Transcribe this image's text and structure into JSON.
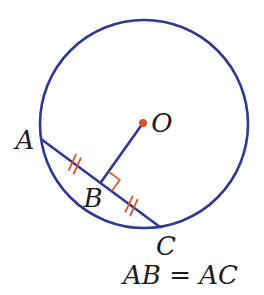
{
  "figure": {
    "canvas": {
      "width": 264,
      "height": 295
    },
    "colors": {
      "line_blue": "#2d3a92",
      "accent_orange": "#dd5227",
      "label_black": "#1b1b1b",
      "background": "#ffffff"
    },
    "circle": {
      "cx": 144,
      "cy": 124,
      "r": 104,
      "stroke_width": 2.6
    },
    "center_dot": {
      "x": 143,
      "y": 123,
      "radius": 4,
      "label": "O",
      "label_x": 162,
      "label_y": 132
    },
    "points": [
      {
        "name": "A",
        "x": 41,
        "y": 139,
        "label": "A",
        "label_x": 25,
        "label_y": 149
      },
      {
        "name": "B",
        "x": 100.4,
        "y": 182.9,
        "label": "B",
        "label_x": 93,
        "label_y": 207
      },
      {
        "name": "C",
        "x": 160,
        "y": 227,
        "label": "C",
        "label_x": 166,
        "label_y": 255
      }
    ],
    "segments": [
      {
        "name": "chord-AC",
        "from": "A",
        "to": "C"
      },
      {
        "name": "segment-OB",
        "from": "O",
        "to": "B"
      }
    ],
    "right_angle_mark": {
      "at": "B",
      "size": 14,
      "stroke_width": 1.6
    },
    "tick_marks": [
      {
        "name": "AB",
        "from": "A",
        "to": "B",
        "t": 0.57,
        "count": 2
      },
      {
        "name": "BC",
        "from": "B",
        "to": "C",
        "t": 0.52,
        "count": 2
      }
    ],
    "tick_style": {
      "half_length": 8.5,
      "pair_offset": 3,
      "angle_from_chord_deg": 102,
      "stroke_width": 1.8
    }
  },
  "caption": {
    "text": "AB = AC"
  }
}
